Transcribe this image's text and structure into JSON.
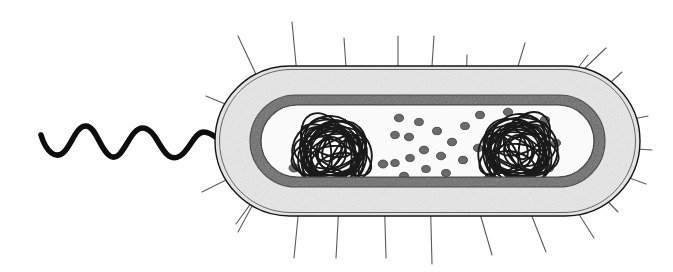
{
  "figure": {
    "background_color": "#ffffff",
    "width": 673,
    "height": 272
  },
  "palette": {
    "outline_black": "#141414",
    "membrane_dark_gray": "#666666",
    "membrane_dark_gray_edge": "#4a4a4a",
    "capsule_fill_light": "#efefef",
    "capsule_speckle": "#b4b4b4",
    "cytoplasm_white": "#fbfbfb",
    "ribosome_gray": "#6b6b6b",
    "ribosome_outline": "#3c3c3c",
    "nucleoid_black": "#1a1a1a",
    "pili_gray": "#5a5a5a",
    "flagellum_black": "#0d0d0d"
  },
  "structures": {
    "flagellum": {
      "name": "flagellum",
      "description": "Single thick black wavy filament attached at the left pole",
      "stroke_color": "#0d0d0d",
      "stroke_width": 5.5,
      "wave_cycles": 3.5,
      "wavelength_px": 30,
      "amplitude_px": 11,
      "start_x": 40,
      "end_x": 232,
      "center_y": 144
    },
    "pili": {
      "name": "pili",
      "description": "Thin straight hair-like appendages radiating outward through the capsule",
      "stroke_color": "#5a5a5a",
      "stroke_width": 1.1,
      "count_top": 9,
      "count_bottom": 9,
      "count_left": 3,
      "count_right": 4,
      "total_count": 25
    },
    "capsule": {
      "name": "capsule",
      "description": "Outer stippled light-gray slime layer enclosed by a thin black outline",
      "fill_color": "#efefef",
      "outline_color": "#141414",
      "outline_width": 1.4,
      "thickness_px": 24
    },
    "cell_wall_membrane": {
      "name": "cell-wall-and-plasma-membrane",
      "description": "Thick medium-gray band representing the cell wall and plasma membrane",
      "fill_color": "#666666",
      "thickness_px": 10
    },
    "cytoplasm": {
      "name": "cytoplasm",
      "description": "Pale interior compartment holding nucleoids and ribosomes",
      "fill_color": "#fbfbfb"
    },
    "nucleoids": {
      "name": "nucleoid",
      "description": "Two dense tangled balls of looping DNA strands",
      "stroke_color": "#1a1a1a",
      "count": 2,
      "positions": [
        {
          "cx": 332,
          "cy": 154,
          "rx": 44,
          "ry": 38,
          "strands": 26
        },
        {
          "cx": 518,
          "cy": 152,
          "rx": 44,
          "ry": 38,
          "strands": 26
        }
      ]
    },
    "ribosomes": {
      "name": "ribosome",
      "description": "Small dark-gray granules scattered through the cytoplasm",
      "fill_color": "#6b6b6b",
      "outline_color": "#3c3c3c",
      "count": 34,
      "mean_width_px": 9,
      "mean_height_px": 7.5
    }
  },
  "labels": {
    "flagellum": "Flagellum",
    "pili": "Pili",
    "capsule": "Capsule",
    "cell_wall": "Cell wall",
    "plasma_membrane": "Plasma membrane",
    "cytoplasm": "Cytoplasm",
    "nucleoid": "Nucleoid (DNA)",
    "ribosomes": "Ribosomes"
  }
}
